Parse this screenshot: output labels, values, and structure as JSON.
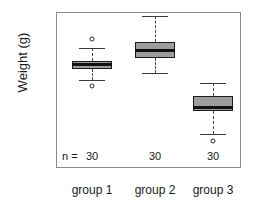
{
  "chart_data": {
    "type": "box",
    "title": "",
    "xlabel": "",
    "ylabel": "Weight (g)",
    "ylim": [
      0,
      19
    ],
    "yticks": [
      0,
      5,
      10,
      15
    ],
    "ytick_labels": [
      "0",
      "5",
      "10",
      "15"
    ],
    "grid": false,
    "legend": null,
    "categories": [
      "group 1",
      "group 2",
      "group 3"
    ],
    "n_label": "n =",
    "counts": [
      "30",
      "30",
      "30"
    ],
    "boxes": [
      {
        "category": "group 1",
        "n": 30,
        "whisker_low": 10.3,
        "q1": 11.8,
        "median": 12.3,
        "q3": 12.8,
        "whisker_high": 14.5,
        "outliers": [
          15.7,
          9.6
        ]
      },
      {
        "category": "group 2",
        "n": 30,
        "whisker_low": 11.2,
        "q1": 13.2,
        "median": 14.1,
        "q3": 15.3,
        "whisker_high": 18.6,
        "outliers": []
      },
      {
        "category": "group 3",
        "n": 30,
        "whisker_low": 3.4,
        "q1": 6.3,
        "median": 6.8,
        "q3": 8.3,
        "whisker_high": 9.9,
        "outliers": [
          2.4
        ]
      }
    ],
    "colors": {
      "box_fill": "#9d9d9d",
      "box_border": "#1c1c1c",
      "median": "#111111",
      "whisker": "#4a4a4a",
      "frame": "#8a8a8a",
      "text": "#1a1a1a"
    }
  }
}
